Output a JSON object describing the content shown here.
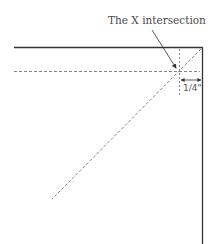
{
  "diagram": {
    "callout_label": "The X intersection",
    "dimension_label": "1/4\"",
    "colors": {
      "solid_line": "#333333",
      "dashed_line": "#777777",
      "text": "#4a4a4a"
    }
  }
}
